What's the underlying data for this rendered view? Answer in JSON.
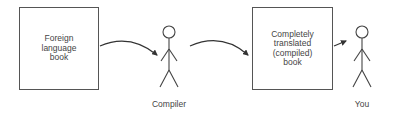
{
  "diagram": {
    "source_box": {
      "text": "Foreign\nlanguage\nbook"
    },
    "output_box": {
      "text": "Completely\ntranslated\n(compiled)\nbook"
    },
    "actors": [
      {
        "label": "Compiler"
      },
      {
        "label": "You"
      }
    ],
    "flow": [
      "Foreign language book",
      "Compiler",
      "Completely translated (compiled) book",
      "You"
    ],
    "colors": {
      "stroke": "#555555",
      "text": "#444444",
      "background": "#ffffff"
    }
  }
}
